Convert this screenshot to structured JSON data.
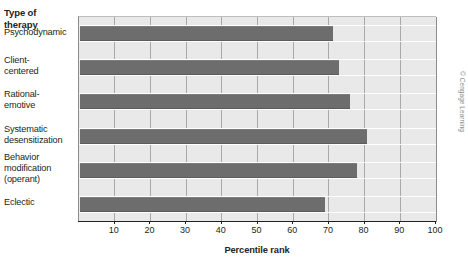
{
  "figure": {
    "category_axis_title": "Type of\ntherapy",
    "category_axis_title_line1": "Type of",
    "category_axis_title_line2": "therapy",
    "credit": "© Cengage Learning"
  },
  "chart_data": {
    "type": "bar",
    "orientation": "horizontal",
    "title": "",
    "xlabel": "Percentile rank",
    "ylabel": "Type of therapy",
    "xlim": [
      0,
      100
    ],
    "xticks": [
      10,
      20,
      30,
      40,
      50,
      60,
      70,
      80,
      90,
      100
    ],
    "xtick_labels": [
      "10",
      "20",
      "30",
      "40",
      "50",
      "60",
      "70",
      "80",
      "90",
      "100"
    ],
    "grid": true,
    "legend": "none",
    "bar_color": "#6d6d6d",
    "plot_background": "#e9e9e9",
    "categories": [
      "Psychodynamic",
      "Client-centered",
      "Rational-emotive",
      "Systematic desensitization",
      "Behavior modification (operant)",
      "Eclectic"
    ],
    "category_label_lines": [
      [
        "Psychodynamic"
      ],
      [
        "Client-",
        "centered"
      ],
      [
        "Rational-",
        "emotive"
      ],
      [
        "Systematic",
        "desensitization"
      ],
      [
        "Behavior",
        "modification",
        "(operant)"
      ],
      [
        "Eclectic"
      ]
    ],
    "values": [
      71,
      72.5,
      75.5,
      80.5,
      77.5,
      68.5
    ]
  }
}
